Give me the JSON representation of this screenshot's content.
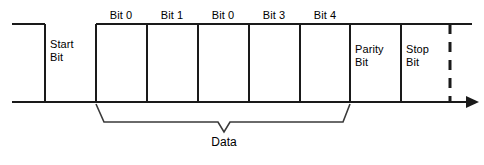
{
  "diagram": {
    "line_color": "#1a1a1a",
    "text_color": "#000000",
    "background_color": "#ffffff",
    "frame_fields": [
      {
        "name": "start-bit",
        "label": "Start\nBit",
        "label_x": 50,
        "label_y": 38
      },
      {
        "name": "parity-bit",
        "label": "Parity\nBit",
        "label_x": 355,
        "label_y": 43
      },
      {
        "name": "stop-bit",
        "label": "Stop\nBit",
        "label_x": 406,
        "label_y": 43
      }
    ],
    "data_bits": [
      {
        "name": "bit-0-a",
        "label": "Bit 0",
        "center_x": 121,
        "label_y": 9
      },
      {
        "name": "bit-1",
        "label": "Bit 1",
        "center_x": 172,
        "label_y": 9
      },
      {
        "name": "bit-0-b",
        "label": "Bit 0",
        "center_x": 223,
        "label_y": 9
      },
      {
        "name": "bit-3",
        "label": "Bit 3",
        "center_x": 274,
        "label_y": 9
      },
      {
        "name": "bit-4",
        "label": "Bit 4",
        "center_x": 325,
        "label_y": 9
      }
    ],
    "group_bracket": {
      "name": "data-brace",
      "label": "Data",
      "label_x": 224,
      "label_y": 142,
      "left_x": 96,
      "right_x": 350,
      "top_y": 104,
      "body_y": 122,
      "tip_x": 224,
      "tip_y": 132
    },
    "axis": {
      "name": "time-axis",
      "baseline_y": 102,
      "high_y": 24,
      "start_x": 12,
      "arrow_x": 478,
      "top_line_end_x": 472
    },
    "dashed_marker": {
      "name": "frame-end-dashed-line",
      "x": 450,
      "top_y": 24,
      "bottom_y": 102
    }
  }
}
